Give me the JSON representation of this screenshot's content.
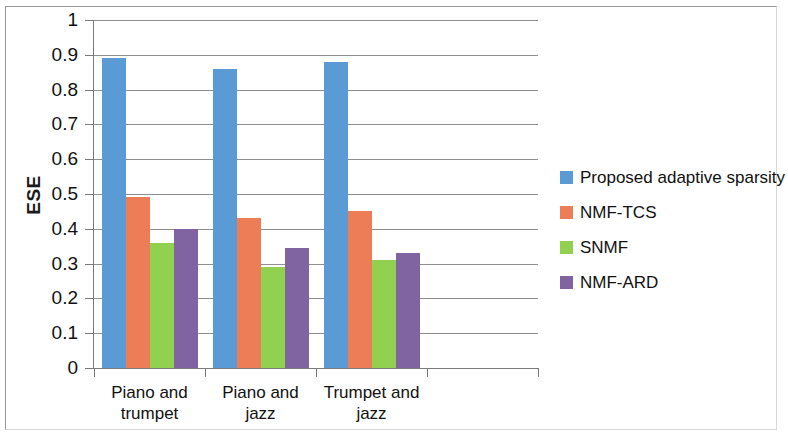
{
  "chart_data": {
    "type": "bar",
    "title": "",
    "xlabel": "",
    "ylabel": "ESE",
    "ylim": [
      0,
      1
    ],
    "ytick_labels": [
      "0",
      "0.1",
      "0.2",
      "0.3",
      "0.4",
      "0.5",
      "0.6",
      "0.7",
      "0.8",
      "0.9",
      "1"
    ],
    "ytick_values": [
      0,
      0.1,
      0.2,
      0.3,
      0.4,
      0.5,
      0.6,
      0.7,
      0.8,
      0.9,
      1
    ],
    "grid": "horizontal",
    "legend_position": "right",
    "categories": [
      "Piano and trumpet",
      "Piano and jazz",
      "Trumpet and jazz"
    ],
    "category_lines": [
      [
        "Piano and",
        "trumpet"
      ],
      [
        "Piano and",
        "jazz"
      ],
      [
        "Trumpet and",
        "jazz"
      ]
    ],
    "series": [
      {
        "name": "Proposed adaptive sparsity",
        "color": "#5B9BD5",
        "values": [
          0.89,
          0.86,
          0.88
        ]
      },
      {
        "name": "NMF-TCS",
        "color": "#ED7D57",
        "values": [
          0.49,
          0.43,
          0.45
        ]
      },
      {
        "name": "SNMF",
        "color": "#92D050",
        "values": [
          0.36,
          0.29,
          0.31
        ]
      },
      {
        "name": "NMF-ARD",
        "color": "#8064A2",
        "values": [
          0.4,
          0.345,
          0.33
        ]
      }
    ]
  },
  "axis": {
    "y_title": "ESE"
  }
}
